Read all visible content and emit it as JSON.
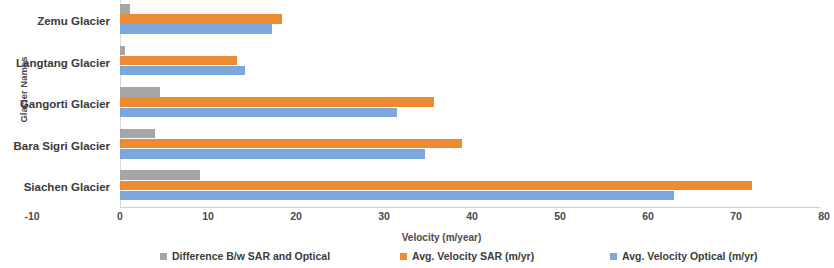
{
  "chart_data": {
    "type": "bar",
    "orientation": "horizontal",
    "title": "",
    "xlabel": "Velocity (m/year)",
    "ylabel": "Glacier Names",
    "categories": [
      "Zemu Glacier",
      "Langtang Glacier",
      "Gangorti Glacier",
      "Bara Sigri Glacier",
      "Siachen Glacier"
    ],
    "series": [
      {
        "name": "Difference B/w SAR and Optical",
        "color": "#a6a6a6",
        "values": [
          1.1,
          0.6,
          4.5,
          4.0,
          9.1
        ]
      },
      {
        "name": "Avg. Velocity SAR (m/yr)",
        "color": "#ed8b33",
        "values": [
          18.4,
          13.3,
          35.7,
          38.9,
          71.8
        ]
      },
      {
        "name": "Avg. Velocity Optical (m/yr)",
        "color": "#7ba7dc",
        "values": [
          17.3,
          14.2,
          31.5,
          34.7,
          63.0
        ]
      }
    ],
    "xlim": [
      -10,
      80
    ],
    "xticks": [
      -10,
      0,
      10,
      20,
      30,
      40,
      50,
      60,
      70,
      80
    ],
    "xtick_labels": [
      "-10",
      "0",
      "10",
      "20",
      "30",
      "40",
      "50",
      "60",
      "70",
      "80"
    ],
    "grid": false,
    "legend_position": "bottom"
  },
  "axis": {
    "y_title": "Glacier Names",
    "x_title": "Velocity (m/year)"
  },
  "legend": {
    "items": [
      {
        "label": "Difference B/w SAR and Optical",
        "swatch": "gray-swatch-icon"
      },
      {
        "label": "Avg. Velocity SAR (m/yr)",
        "swatch": "orange-swatch-icon"
      },
      {
        "label": "Avg. Velocity Optical (m/yr)",
        "swatch": "blue-swatch-icon"
      }
    ]
  }
}
